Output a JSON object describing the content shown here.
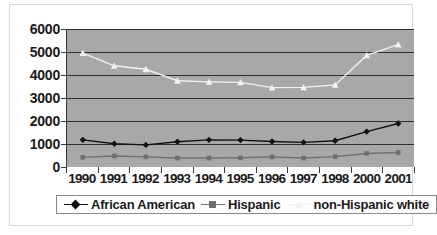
{
  "chart_data": {
    "type": "line",
    "title": "",
    "subtitle": "",
    "xlabel": "",
    "ylabel": "",
    "categories": [
      "1990",
      "1991",
      "1992",
      "1993",
      "1994",
      "1995",
      "1996",
      "1997",
      "1998",
      "2000",
      "2001"
    ],
    "ylim": [
      0,
      6000
    ],
    "y_ticks": [
      0,
      1000,
      2000,
      3000,
      4000,
      5000,
      6000
    ],
    "y_tick_labels": [
      "0",
      "1000",
      "2000",
      "3000",
      "4000",
      "5000",
      "6000"
    ],
    "grid": true,
    "legend_position": "bottom",
    "plot_background": "#a8a8a8",
    "series": [
      {
        "name": "African American",
        "marker": "diamond",
        "color": "#111111",
        "line_color": "#111111",
        "values": [
          1180,
          1010,
          960,
          1100,
          1180,
          1170,
          1110,
          1070,
          1140,
          1540,
          1890
        ]
      },
      {
        "name": "Hispanic",
        "marker": "square",
        "color": "#6f6f6f",
        "line_color": "#6f6f6f",
        "values": [
          420,
          480,
          440,
          390,
          390,
          400,
          440,
          390,
          450,
          590,
          630
        ]
      },
      {
        "name": "non-Hispanic white",
        "marker": "triangle",
        "color": "#f2f2f2",
        "line_color": "#f2f2f2",
        "values": [
          4950,
          4400,
          4250,
          3750,
          3700,
          3680,
          3450,
          3460,
          3570,
          4850,
          5320
        ]
      }
    ]
  },
  "legend": {
    "entries": [
      {
        "label": "African American"
      },
      {
        "label": "Hispanic"
      },
      {
        "label": "non-Hispanic white"
      }
    ]
  }
}
